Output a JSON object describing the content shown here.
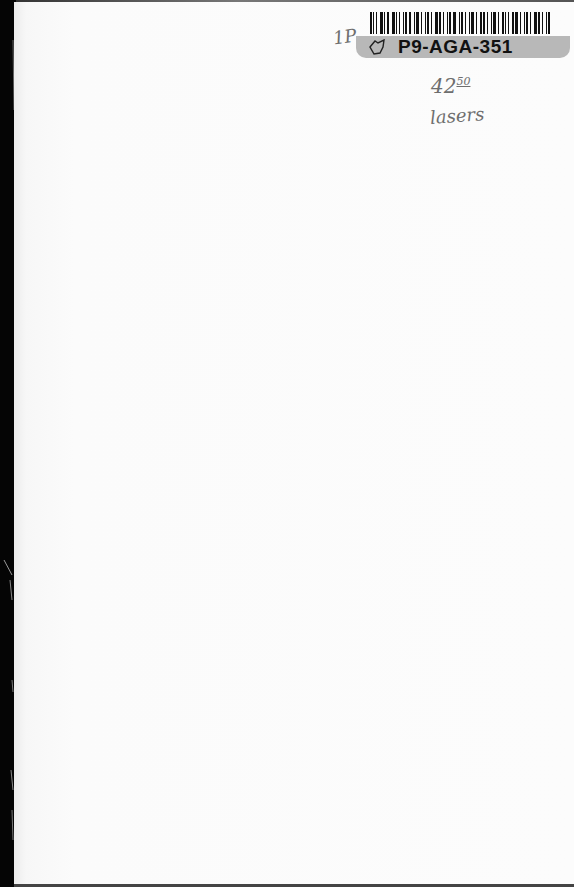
{
  "document": {
    "type": "scanned book endpaper",
    "background_color": "#fbfbfb",
    "spine_color": "#0a0a0a"
  },
  "library_sticker": {
    "barcode_icon": "barcode-icon",
    "catalog_number": "P9-AGA-351",
    "tag_icon": "price-tag-icon",
    "band_color": "#b8b8b8"
  },
  "handwritten_notes": {
    "top_left_mark": "1P",
    "price_main": "42",
    "price_cents": "50",
    "subject": "lasers"
  }
}
